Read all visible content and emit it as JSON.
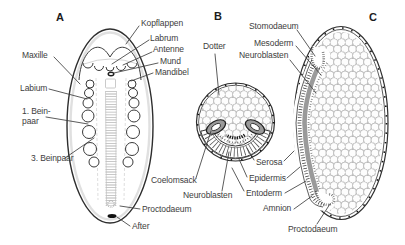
{
  "colors": {
    "background": "#ffffff",
    "ink": "#2e2e2e",
    "label_text": "#3d3d3d",
    "gray_fill": "#9a9a9a",
    "yolk_outline": "#b4b4b4"
  },
  "panels": {
    "a": "A",
    "b": "B",
    "c": "C"
  },
  "icons": {
    "yolk_sphere": "circle-pattern",
    "coelom_sac": "gray-oval",
    "anus_spot": "black-oval"
  },
  "labels": {
    "kopflappen": "Kopflappen",
    "labrum": "Labrum",
    "antenne": "Antenne",
    "mund": "Mund",
    "mandibel": "Mandibel",
    "maxille": "Maxille",
    "labium": "Labium",
    "beinpaar1_line1": "1. Bein-",
    "beinpaar1_line2": "paar",
    "beinpaar3": "3. Beinpaar",
    "proctodaeum_a": "Proctodaeum",
    "after": "After",
    "dotter": "Dotter",
    "coelomsack": "Coelomsack",
    "neuroblasten_b": "Neuroblasten",
    "stomodaeum": "Stomodaeum",
    "mesoderm": "Mesoderm",
    "neuroblasten_c": "Neuroblasten",
    "serosa": "Serosa",
    "epidermis": "Epidermis",
    "entoderm": "Entoderm",
    "amnion": "Amnion",
    "proctodaeum_c": "Proctodaeum"
  }
}
